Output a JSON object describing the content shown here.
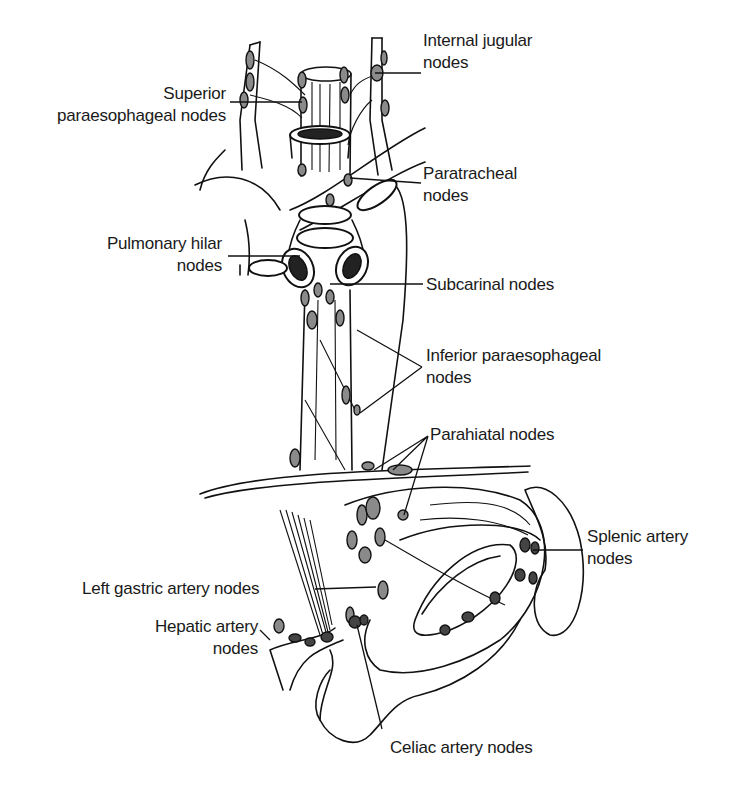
{
  "figure": {
    "labels": {
      "internal_jugular": "Internal jugular\nnodes",
      "superior_paraesophageal": "Superior\nparaesophageal nodes",
      "paratracheal": "Paratracheal\nnodes",
      "pulmonary_hilar": "Pulmonary hilar\nnodes",
      "subcarinal": "Subcarinal nodes",
      "inferior_paraesophageal": "Inferior paraesophageal\nnodes",
      "parahiatal": "Parahiatal nodes",
      "splenic_artery": "Splenic artery\nnodes",
      "left_gastric_artery": "Left gastric artery nodes",
      "hepatic_artery": "Hepatic artery\nnodes",
      "celiac_artery": "Celiac artery nodes"
    },
    "colors": {
      "ink": "#111111",
      "node_fill": "#8a8a8a",
      "background": "#ffffff"
    }
  }
}
